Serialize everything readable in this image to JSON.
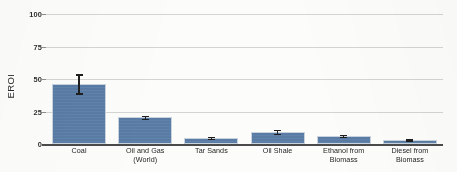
{
  "chart_data": {
    "type": "bar",
    "title": "",
    "xlabel": "",
    "ylabel": "EROI",
    "ylim": [
      0,
      100
    ],
    "grid": true,
    "legend": "none",
    "categories": [
      "Coal",
      "Oil and Gas (World)",
      "Tar Sands",
      "Oil Shale",
      "Ethanol from Biomass",
      "Diesel from Biomass"
    ],
    "category_lines": [
      [
        "Coal"
      ],
      [
        "Oil and Gas",
        "(World)"
      ],
      [
        "Tar Sands"
      ],
      [
        "Oil Shale"
      ],
      [
        "Ethanol from",
        "Biomass"
      ],
      [
        "Diesel from",
        "Biomass"
      ]
    ],
    "values": [
      46,
      20.8,
      4.8,
      9.4,
      6.4,
      3.0
    ],
    "error_low": [
      39.0,
      19.6,
      4.0,
      8.0,
      5.6,
      2.4
    ],
    "error_high": [
      53.5,
      21.8,
      5.6,
      10.8,
      7.2,
      3.6
    ],
    "yticks": [
      0,
      25,
      50,
      75,
      100
    ],
    "ytick_labels": [
      "0",
      "25",
      "50",
      "75",
      "100"
    ],
    "colors": {
      "bar_fill": "#5b7ea8",
      "bar_edge": "#c9d3de",
      "gridline": "#d4d4d2",
      "axis_line": "#4a4a4a",
      "error_bar": "#1e1e1e",
      "text": "#242424",
      "background": "#fcfcfa"
    }
  }
}
